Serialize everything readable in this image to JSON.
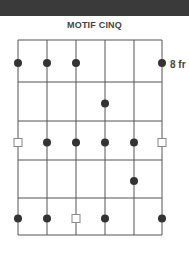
{
  "title": "MOTIF CINQ",
  "fret_label": "8 fr",
  "colors": {
    "grid": "#555555",
    "dot": "#333333",
    "square": "#888888",
    "topbar": "#3a3a3a"
  },
  "grid": {
    "strings": 6,
    "frets": 5
  },
  "markers": [
    {
      "fret": 1,
      "string": 1,
      "type": "dot"
    },
    {
      "fret": 1,
      "string": 2,
      "type": "dot"
    },
    {
      "fret": 1,
      "string": 3,
      "type": "dot"
    },
    {
      "fret": 1,
      "string": 6,
      "type": "dot"
    },
    {
      "fret": 2,
      "string": 4,
      "type": "dot"
    },
    {
      "fret": 3,
      "string": 1,
      "type": "square"
    },
    {
      "fret": 3,
      "string": 2,
      "type": "dot"
    },
    {
      "fret": 3,
      "string": 3,
      "type": "dot"
    },
    {
      "fret": 3,
      "string": 4,
      "type": "dot"
    },
    {
      "fret": 3,
      "string": 5,
      "type": "dot"
    },
    {
      "fret": 3,
      "string": 6,
      "type": "square"
    },
    {
      "fret": 4,
      "string": 5,
      "type": "dot"
    },
    {
      "fret": 5,
      "string": 1,
      "type": "dot"
    },
    {
      "fret": 5,
      "string": 2,
      "type": "dot"
    },
    {
      "fret": 5,
      "string": 3,
      "type": "square"
    },
    {
      "fret": 5,
      "string": 4,
      "type": "dot"
    },
    {
      "fret": 5,
      "string": 6,
      "type": "dot"
    }
  ]
}
